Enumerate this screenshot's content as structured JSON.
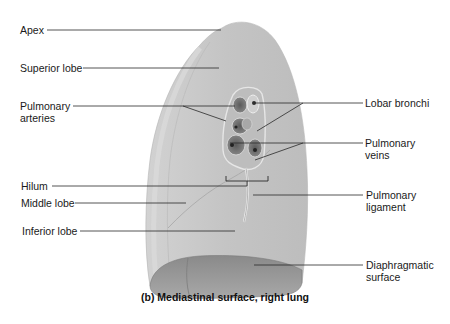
{
  "figure": {
    "caption": "(b) Mediastinal surface, right lung",
    "colors": {
      "background": "#ffffff",
      "lung_surface": "#c9c9c9",
      "lung_shadow": "#9a9a9a",
      "hilum_dark": "#4a4a4a",
      "leader_line": "#2a2a2a",
      "label_text": "#1a1a1a"
    }
  },
  "labels_left": [
    {
      "id": "apex",
      "text": "Apex"
    },
    {
      "id": "superior-lobe",
      "text": "Superior lobe"
    },
    {
      "id": "pulmonary-arteries",
      "line1": "Pulmonary",
      "line2": "arteries"
    },
    {
      "id": "hilum",
      "text": "Hilum"
    },
    {
      "id": "middle-lobe",
      "text": "Middle lobe"
    },
    {
      "id": "inferior-lobe",
      "text": "Inferior lobe"
    }
  ],
  "labels_right": [
    {
      "id": "lobar-bronchi",
      "text": "Lobar bronchi"
    },
    {
      "id": "pulmonary-veins",
      "line1": "Pulmonary",
      "line2": "veins"
    },
    {
      "id": "pulmonary-ligament",
      "line1": "Pulmonary",
      "line2": "ligament"
    },
    {
      "id": "diaphragmatic-surface",
      "line1": "Diaphragmatic",
      "line2": "surface"
    }
  ]
}
